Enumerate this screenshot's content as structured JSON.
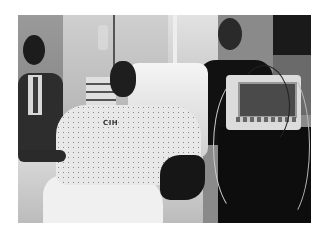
{
  "photo": {
    "description": "Black and white photograph of a man in a hospital gown sitting in a hospital bed, with a suited man at left and a man in dark shirt standing behind a patient monitor at right",
    "gown_label": "CIH",
    "colors": {
      "background": "#ffffff",
      "mode": "grayscale"
    }
  }
}
